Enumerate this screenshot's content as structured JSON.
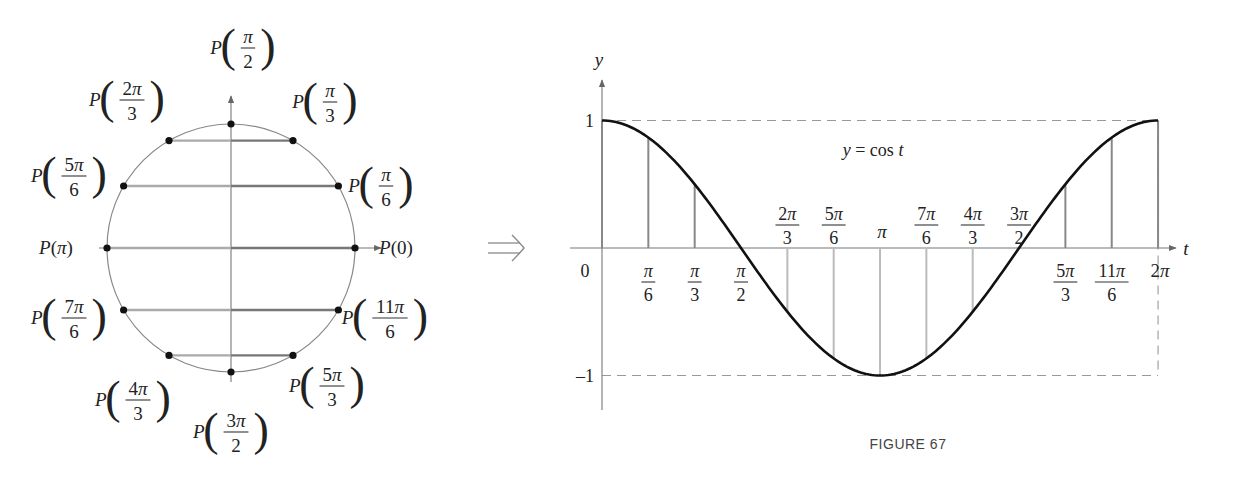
{
  "unit_circle": {
    "center": [
      231,
      248
    ],
    "radius": 124,
    "points": [
      {
        "name": "P(0)",
        "num": "0",
        "den": "",
        "angle_deg": 0,
        "label_pos": [
          396,
          248
        ]
      },
      {
        "name": "P(π/6)",
        "num": "π",
        "den": "6",
        "angle_deg": 30,
        "label_pos": [
          378,
          186
        ]
      },
      {
        "name": "P(π/3)",
        "num": "π",
        "den": "3",
        "angle_deg": 60,
        "label_pos": [
          322,
          102
        ]
      },
      {
        "name": "P(π/2)",
        "num": "π",
        "den": "2",
        "angle_deg": 90,
        "label_pos": [
          240,
          48
        ]
      },
      {
        "name": "P(2π/3)",
        "num": "2π",
        "den": "3",
        "angle_deg": 120,
        "label_pos": [
          124,
          100
        ]
      },
      {
        "name": "P(5π/6)",
        "num": "5π",
        "den": "6",
        "angle_deg": 150,
        "label_pos": [
          66,
          176
        ]
      },
      {
        "name": "P(π)",
        "num": "π",
        "den": "",
        "angle_deg": 180,
        "label_pos": [
          56,
          248
        ]
      },
      {
        "name": "P(7π/6)",
        "num": "7π",
        "den": "6",
        "angle_deg": 210,
        "label_pos": [
          66,
          318
        ]
      },
      {
        "name": "P(4π/3)",
        "num": "4π",
        "den": "3",
        "angle_deg": 240,
        "label_pos": [
          130,
          400
        ]
      },
      {
        "name": "P(3π/2)",
        "num": "3π",
        "den": "2",
        "angle_deg": 270,
        "label_pos": [
          228,
          432
        ]
      },
      {
        "name": "P(5π/3)",
        "num": "5π",
        "den": "3",
        "angle_deg": 300,
        "label_pos": [
          324,
          386
        ]
      },
      {
        "name": "P(11π/6)",
        "num": "11π",
        "den": "6",
        "angle_deg": 330,
        "label_pos": [
          382,
          318
        ]
      }
    ]
  },
  "implies_symbol": "⟹",
  "chart_data": {
    "type": "line",
    "title": "y = cos t",
    "xlabel": "t",
    "ylabel": "y",
    "xlim": [
      0,
      6.2832
    ],
    "ylim": [
      -1,
      1
    ],
    "y_ticks": [
      {
        "value": 1,
        "label": "1"
      },
      {
        "value": -1,
        "label": "–1"
      }
    ],
    "origin_label": "0",
    "x_ticks": [
      {
        "value": 0.5236,
        "num": "π",
        "den": "6",
        "side": "below"
      },
      {
        "value": 1.0472,
        "num": "π",
        "den": "3",
        "side": "below"
      },
      {
        "value": 1.5708,
        "num": "π",
        "den": "2",
        "side": "below"
      },
      {
        "value": 2.0944,
        "num": "2π",
        "den": "3",
        "side": "above"
      },
      {
        "value": 2.618,
        "num": "5π",
        "den": "6",
        "side": "above"
      },
      {
        "value": 3.1416,
        "num": "π",
        "den": "",
        "side": "above"
      },
      {
        "value": 3.6652,
        "num": "7π",
        "den": "6",
        "side": "above"
      },
      {
        "value": 4.1888,
        "num": "4π",
        "den": "3",
        "side": "above"
      },
      {
        "value": 4.7124,
        "num": "3π",
        "den": "2",
        "side": "above"
      },
      {
        "value": 5.236,
        "num": "5π",
        "den": "3",
        "side": "below"
      },
      {
        "value": 5.7596,
        "num": "11π",
        "den": "6",
        "side": "below"
      },
      {
        "value": 6.2832,
        "num": "2π",
        "den": "",
        "side": "below"
      }
    ],
    "x": [
      0,
      0.5236,
      1.0472,
      1.5708,
      2.0944,
      2.618,
      3.1416,
      3.6652,
      4.1888,
      4.7124,
      5.236,
      5.7596,
      6.2832
    ],
    "values": [
      1,
      0.866,
      0.5,
      0,
      -0.5,
      -0.866,
      -1,
      -0.866,
      -0.5,
      0,
      0.5,
      0.866,
      1
    ],
    "series": [
      {
        "name": "y = cos t",
        "values": [
          1,
          0.866,
          0.5,
          0,
          -0.5,
          -0.866,
          -1,
          -0.866,
          -0.5,
          0,
          0.5,
          0.866,
          1
        ]
      }
    ],
    "grid": false,
    "dashed_guides": [
      "y = 1",
      "y = -1",
      "t = 2π"
    ],
    "annotation": "y = cos t"
  },
  "graph_geom": {
    "x0": 602,
    "y0": 248,
    "xscale": 88.5,
    "yscale": 127.5
  },
  "caption": "FIGURE 67"
}
